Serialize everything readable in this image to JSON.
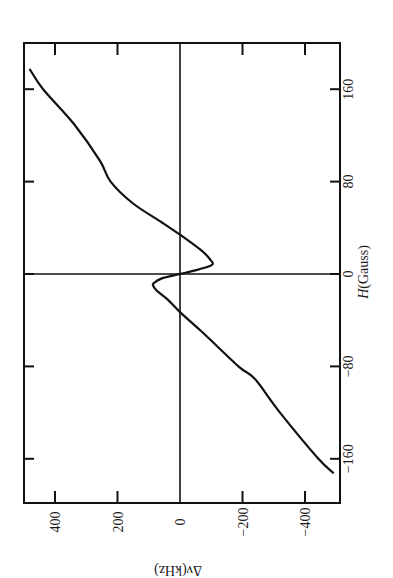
{
  "chart_data": {
    "type": "line",
    "title": "",
    "orientation_note": "figure rotated 90 degrees: H axis runs vertically, delta-nu axis runs horizontally",
    "xlabel": "H(Gauss)",
    "ylabel": "Δν(kHz)",
    "xlim": [
      -178,
      200
    ],
    "ylim": [
      -508,
      500
    ],
    "x_ticks": [
      -160,
      -80,
      0,
      80,
      160
    ],
    "y_ticks": [
      400,
      200,
      0,
      -200,
      -400
    ],
    "x_tick_labels": [
      "−160",
      "−80",
      "0",
      "80",
      "160"
    ],
    "y_tick_labels": [
      "400",
      "200",
      "0",
      "−200",
      "−400"
    ],
    "grid": false,
    "zero_lines": true,
    "legend": null,
    "series": [
      {
        "name": "Δν vs H",
        "x": [
          177,
          160,
          130,
          98,
          80,
          61,
          45,
          34,
          20,
          12,
          8,
          4,
          0,
          -4,
          -8,
          -10,
          -14,
          -22,
          -33,
          -50,
          -80,
          -91,
          -120,
          -160,
          -172
        ],
        "y": [
          480,
          438,
          340,
          256,
          222,
          150,
          60,
          0,
          -70,
          -98,
          -102,
          -60,
          0,
          60,
          84,
          86,
          76,
          40,
          0,
          -70,
          -187,
          -240,
          -320,
          -443,
          -490
        ]
      }
    ]
  },
  "labels": {
    "x_axis_title_italic": "H",
    "x_axis_title_rest": "(Gauss)",
    "y_axis_title": "Δν(kHz)"
  }
}
